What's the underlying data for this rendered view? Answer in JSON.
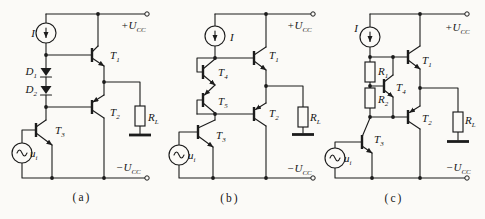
{
  "figure": {
    "ink_color": "#1c1c1c",
    "paper_color": "#fbfaf7",
    "circuits": [
      {
        "id": "a",
        "caption": "(a)",
        "labels": {
          "bias_current": {
            "t": "I",
            "s": ""
          },
          "pos_supply": {
            "t": "+U",
            "s": "CC"
          },
          "neg_supply": {
            "t": "−U",
            "s": "CC"
          },
          "d1": {
            "t": "D",
            "s": "1"
          },
          "d2": {
            "t": "D",
            "s": "2"
          },
          "t1": {
            "t": "T",
            "s": "1"
          },
          "t2": {
            "t": "T",
            "s": "2"
          },
          "t3": {
            "t": "T",
            "s": "3"
          },
          "load": {
            "t": "R",
            "s": "L"
          },
          "input": {
            "t": "u",
            "s": "i"
          }
        }
      },
      {
        "id": "b",
        "caption": "(b)",
        "labels": {
          "bias_current": {
            "t": "I",
            "s": ""
          },
          "pos_supply": {
            "t": "+U",
            "s": "CC"
          },
          "neg_supply": {
            "t": "−U",
            "s": "CC"
          },
          "t1": {
            "t": "T",
            "s": "1"
          },
          "t2": {
            "t": "T",
            "s": "2"
          },
          "t3": {
            "t": "T",
            "s": "3"
          },
          "t4": {
            "t": "T",
            "s": "4"
          },
          "t5": {
            "t": "T",
            "s": "5"
          },
          "load": {
            "t": "R",
            "s": "L"
          },
          "input": {
            "t": "u",
            "s": "i"
          }
        }
      },
      {
        "id": "c",
        "caption": "(c)",
        "labels": {
          "bias_current": {
            "t": "I",
            "s": ""
          },
          "pos_supply": {
            "t": "+U",
            "s": "CC"
          },
          "neg_supply": {
            "t": "−U",
            "s": "CC"
          },
          "r1": {
            "t": "R",
            "s": "1"
          },
          "r2": {
            "t": "R",
            "s": "2"
          },
          "t1": {
            "t": "T",
            "s": "1"
          },
          "t2": {
            "t": "T",
            "s": "2"
          },
          "t3": {
            "t": "T",
            "s": "3"
          },
          "t4": {
            "t": "T",
            "s": "4"
          },
          "load": {
            "t": "R",
            "s": "L"
          },
          "input": {
            "t": "u",
            "s": "i"
          }
        }
      }
    ]
  }
}
